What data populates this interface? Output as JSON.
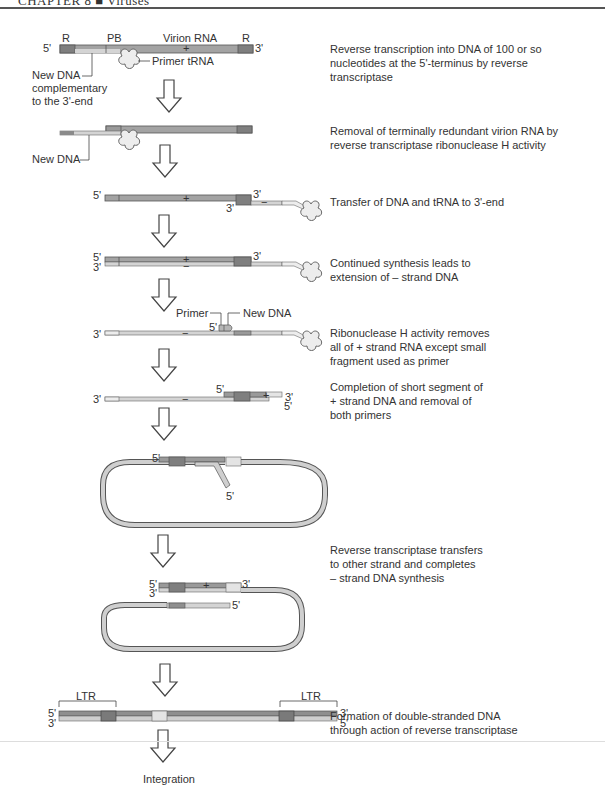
{
  "header": {
    "chapter": "CHAPTER 8",
    "separator": "■",
    "section": "Viruses"
  },
  "colors": {
    "rna_dark": "#8c8c8c",
    "rna_mid": "#a8a8a8",
    "dna_light": "#cfcfcf",
    "dna_lighter": "#e4e4e4",
    "outline": "#555555",
    "arrow_fill": "#ffffff",
    "arrow_stroke": "#444444"
  },
  "step1": {
    "labels": {
      "five": "5'",
      "three": "3'",
      "r_left": "R",
      "pb": "PB",
      "virion_rna": "Virion RNA",
      "r_right": "R",
      "plus": "+",
      "primer_trna": "Primer tRNA",
      "new_dna_1": "New DNA",
      "new_dna_2": "complementary",
      "new_dna_3": "to the 3'-end"
    },
    "description": [
      "Reverse transcription into DNA of 100 or so",
      "nucleotides at the 5'-terminus by reverse",
      "transcriptase"
    ]
  },
  "step2": {
    "labels": {
      "new_dna": "New DNA"
    },
    "description": [
      "Removal of terminally redundant virion RNA by",
      "reverse transcriptase ribonuclease H activity"
    ]
  },
  "step3": {
    "labels": {
      "five": "5'",
      "three_top": "3'",
      "three_bottom": "3'",
      "plus": "+",
      "minus": "−"
    },
    "description": [
      "Transfer of DNA and tRNA to 3'-end"
    ]
  },
  "step4": {
    "labels": {
      "five": "5'",
      "three_left": "3'",
      "three_right": "3'",
      "plus": "+",
      "minus": "−"
    },
    "description": [
      "Continued synthesis leads to",
      "extension of – strand DNA"
    ]
  },
  "step5": {
    "labels": {
      "primer": "Primer",
      "new_dna": "New DNA",
      "five": "5'",
      "three": "3'",
      "minus": "−"
    },
    "description": [
      "Ribonuclease H activity removes",
      "all of + strand RNA except small",
      "fragment used as primer"
    ]
  },
  "step6": {
    "labels": {
      "three_left": "3'",
      "five_top": "5'",
      "three_right": "3'",
      "five_bottom": "5'",
      "plus": "+",
      "minus": "−"
    },
    "description": [
      "Completion of short segment of",
      "+ strand DNA and removal of",
      "both primers"
    ]
  },
  "step7": {
    "labels": {
      "five_top": "5'",
      "five_tail": "5'"
    }
  },
  "step8": {
    "labels": {
      "five_top": "5'",
      "three_left": "3'",
      "three_right": "3'",
      "five_inner": "5'",
      "plus": "+"
    },
    "description": [
      "Reverse transcriptase transfers",
      "to other strand and completes",
      "– strand DNA synthesis"
    ]
  },
  "step9": {
    "labels": {
      "ltr_left": "LTR",
      "ltr_right": "LTR",
      "five_left": "5'",
      "three_left": "3'",
      "three_right": "3'",
      "five_right": "5'"
    },
    "description": [
      "Formation of double-stranded DNA",
      "through action of reverse transcriptase"
    ]
  },
  "final": {
    "label": "Integration"
  }
}
